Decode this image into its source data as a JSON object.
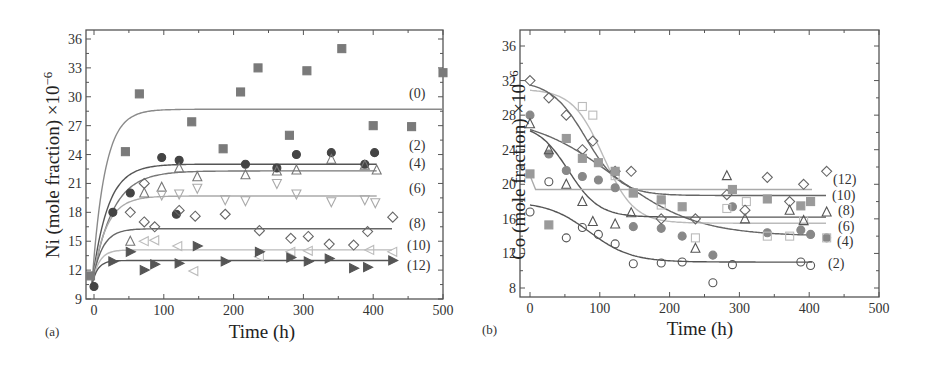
{
  "chart_data": [
    {
      "panel": "(a)",
      "type": "scatter",
      "title": "",
      "xlabel": "Time (h)",
      "ylabel": "Ni (mole fraction) ×10",
      "ylabel_exponent": "−6",
      "xlim": [
        -10,
        500
      ],
      "ylim": [
        9,
        37
      ],
      "xticks": [
        0,
        100,
        200,
        300,
        400,
        500
      ],
      "yticks": [
        9,
        12,
        15,
        18,
        21,
        24,
        27,
        30,
        33,
        36
      ],
      "grid": false,
      "legend": "inline curve labels at right",
      "series": [
        {
          "name": "(0)",
          "marker": "square",
          "fill": "#7a7a7a",
          "line": "#8a8a8a",
          "plateau": 28.7,
          "rate": 0.055,
          "points": [
            [
              -5,
              11.4
            ],
            [
              45,
              24.3
            ],
            [
              65,
              30.3
            ],
            [
              140,
              27.4
            ],
            [
              185,
              24.6
            ],
            [
              210,
              30.5
            ],
            [
              235,
              33.0
            ],
            [
              280,
              26.0
            ],
            [
              305,
              32.7
            ],
            [
              355,
              35.0
            ],
            [
              400,
              27.0
            ],
            [
              455,
              26.9
            ],
            [
              500,
              32.5
            ]
          ]
        },
        {
          "name": "(2)",
          "marker": "circle",
          "fill": "#444444",
          "line": "#555555",
          "plateau": 23.0,
          "rate": 0.045,
          "points": [
            [
              0,
              10.3
            ],
            [
              27,
              18.0
            ],
            [
              52,
              20.0
            ],
            [
              97,
              23.7
            ],
            [
              122,
              23.4
            ],
            [
              118,
              17.8
            ],
            [
              217,
              23.0
            ],
            [
              262,
              22.6
            ],
            [
              290,
              24.0
            ],
            [
              340,
              24.2
            ],
            [
              388,
              23.0
            ],
            [
              402,
              24.2
            ]
          ]
        },
        {
          "name": "(4)",
          "marker": "triangle-up",
          "fill": "none",
          "line": "#777777",
          "plateau": 22.3,
          "rate": 0.035,
          "points": [
            [
              52,
              15.0
            ],
            [
              72,
              20.0
            ],
            [
              97,
              20.6
            ],
            [
              122,
              22.6
            ],
            [
              148,
              21.7
            ],
            [
              217,
              21.9
            ],
            [
              262,
              22.3
            ],
            [
              290,
              22.4
            ],
            [
              340,
              23.5
            ],
            [
              388,
              22.9
            ],
            [
              405,
              22.4
            ]
          ]
        },
        {
          "name": "(6)",
          "marker": "triangle-down",
          "fill": "none",
          "line": "#aaaaaa",
          "plateau": 19.7,
          "rate": 0.05,
          "points": [
            [
              97,
              19.8
            ],
            [
              122,
              19.9
            ],
            [
              148,
              20.5
            ],
            [
              188,
              19.3
            ],
            [
              217,
              19.2
            ],
            [
              262,
              21.0
            ],
            [
              290,
              19.9
            ],
            [
              340,
              19.1
            ],
            [
              388,
              19.3
            ],
            [
              403,
              19.0
            ]
          ]
        },
        {
          "name": "(8)",
          "marker": "diamond",
          "fill": "none",
          "line": "#666666",
          "plateau": 16.3,
          "rate": 0.07,
          "points": [
            [
              52,
              18.0
            ],
            [
              72,
              21.0
            ],
            [
              72,
              17.0
            ],
            [
              87,
              16.5
            ],
            [
              122,
              18.2
            ],
            [
              145,
              17.6
            ],
            [
              188,
              17.8
            ],
            [
              237,
              16.1
            ],
            [
              282,
              15.3
            ],
            [
              307,
              15.5
            ],
            [
              337,
              14.7
            ],
            [
              372,
              14.6
            ],
            [
              392,
              16.0
            ],
            [
              428,
              17.5
            ]
          ]
        },
        {
          "name": "(10)",
          "marker": "triangle-left",
          "fill": "none",
          "line": "#bbbbbb",
          "plateau": 14.1,
          "rate": 0.1,
          "points": [
            [
              72,
              15.0
            ],
            [
              87,
              15.1
            ],
            [
              120,
              14.5
            ],
            [
              143,
              11.9
            ],
            [
              237,
              13.4
            ],
            [
              282,
              13.9
            ],
            [
              307,
              14.0
            ],
            [
              395,
              14.1
            ],
            [
              428,
              13.9
            ]
          ]
        },
        {
          "name": "(12)",
          "marker": "triangle-right",
          "fill": "#555555",
          "line": "#555555",
          "plateau": 13.0,
          "rate": 0.12,
          "points": [
            [
              27,
              12.9
            ],
            [
              52,
              13.9
            ],
            [
              72,
              12.0
            ],
            [
              87,
              12.6
            ],
            [
              122,
              12.7
            ],
            [
              148,
              14.5
            ],
            [
              188,
              12.9
            ],
            [
              237,
              13.9
            ],
            [
              282,
              13.3
            ],
            [
              307,
              12.9
            ],
            [
              337,
              13.2
            ],
            [
              372,
              12.2
            ],
            [
              392,
              12.3
            ],
            [
              428,
              13.0
            ]
          ]
        }
      ],
      "curve_labels": [
        "(0)",
        "(2)",
        "(4)",
        "(6)",
        "(8)",
        "(10)",
        "(12)"
      ]
    },
    {
      "panel": "(b)",
      "type": "scatter",
      "title": "",
      "xlabel": "Time (h)",
      "ylabel": "Co (mole fraction) ×10",
      "ylabel_exponent": "−6",
      "xlim": [
        -10,
        500
      ],
      "ylim": [
        7,
        38
      ],
      "xticks": [
        0,
        100,
        200,
        300,
        400,
        500
      ],
      "yticks": [
        8,
        12,
        16,
        20,
        24,
        28,
        32,
        36
      ],
      "grid": false,
      "legend": "inline curve labels at right",
      "series": [
        {
          "name": "(2)",
          "marker": "circle",
          "fill": "none",
          "line": "#555555",
          "start": 18.0,
          "plateau": 11.0,
          "mid": 85,
          "width": 30,
          "points": [
            [
              0,
              16.8
            ],
            [
              27,
              20.3
            ],
            [
              52,
              13.8
            ],
            [
              75,
              15.0
            ],
            [
              98,
              14.2
            ],
            [
              122,
              13.1
            ],
            [
              148,
              10.8
            ],
            [
              188,
              10.9
            ],
            [
              218,
              11.0
            ],
            [
              262,
              8.6
            ],
            [
              290,
              10.7
            ],
            [
              388,
              11.0
            ],
            [
              402,
              10.6
            ]
          ]
        },
        {
          "name": "(4)",
          "marker": "circle-filled",
          "fill": "#888888",
          "line": "#666666",
          "start": 28.0,
          "plateau": 14.0,
          "mid": 120,
          "width": 60,
          "points": [
            [
              0,
              28.0
            ],
            [
              27,
              23.5
            ],
            [
              52,
              21.6
            ],
            [
              75,
              20.9
            ],
            [
              98,
              20.5
            ],
            [
              122,
              19.6
            ],
            [
              148,
              15.1
            ],
            [
              188,
              14.9
            ],
            [
              218,
              14.0
            ],
            [
              262,
              11.8
            ],
            [
              290,
              17.4
            ],
            [
              340,
              14.4
            ],
            [
              388,
              14.7
            ],
            [
              402,
              14.2
            ],
            [
              425,
              13.8
            ]
          ]
        },
        {
          "name": "(6)",
          "marker": "square-open",
          "fill": "none",
          "line": "#bbbbbb",
          "start": 31.0,
          "plateau": 15.5,
          "mid": 105,
          "width": 22,
          "points": [
            [
              75,
              29.0
            ],
            [
              90,
              28.0
            ],
            [
              122,
              21.0
            ],
            [
              148,
              19.0
            ],
            [
              188,
              17.6
            ],
            [
              237,
              13.8
            ],
            [
              282,
              17.2
            ],
            [
              310,
              18.0
            ],
            [
              340,
              14.0
            ],
            [
              372,
              14.0
            ],
            [
              392,
              15.8
            ],
            [
              425,
              13.8
            ]
          ]
        },
        {
          "name": "(8)",
          "marker": "triangle-up",
          "fill": "none",
          "line": "#555555",
          "start": 27.0,
          "plateau": 16.2,
          "mid": 55,
          "width": 22,
          "points": [
            [
              0,
              27.0
            ],
            [
              27,
              24.0
            ],
            [
              52,
              20.0
            ],
            [
              75,
              18.0
            ],
            [
              90,
              15.7
            ],
            [
              122,
              15.4
            ],
            [
              145,
              16.7
            ],
            [
              237,
              12.6
            ],
            [
              282,
              21.0
            ],
            [
              308,
              16.0
            ],
            [
              372,
              17.0
            ],
            [
              392,
              15.8
            ],
            [
              425,
              16.8
            ]
          ]
        },
        {
          "name": "(10)",
          "marker": "diamond",
          "fill": "none",
          "line": "#666666",
          "start": 32.0,
          "plateau": 18.7,
          "mid": 80,
          "width": 25,
          "points": [
            [
              0,
              32.0
            ],
            [
              27,
              30.0
            ],
            [
              52,
              28.0
            ],
            [
              75,
              24.0
            ],
            [
              90,
              25.0
            ],
            [
              122,
              21.5
            ],
            [
              145,
              21.5
            ],
            [
              188,
              16.0
            ],
            [
              237,
              16.0
            ],
            [
              282,
              18.8
            ],
            [
              308,
              17.0
            ],
            [
              340,
              20.8
            ],
            [
              372,
              18.0
            ],
            [
              392,
              20.0
            ],
            [
              425,
              21.5
            ]
          ]
        },
        {
          "name": "(12)",
          "marker": "square-filled",
          "fill": "#9a9a9a",
          "line": "#aaaaaa",
          "start": 21.0,
          "plateau": 19.4,
          "mid": 3,
          "width": 1.5,
          "points": [
            [
              0,
              21.2
            ],
            [
              27,
              15.3
            ],
            [
              52,
              25.3
            ],
            [
              75,
              23.0
            ],
            [
              98,
              22.5
            ],
            [
              122,
              21.5
            ],
            [
              148,
              19.0
            ],
            [
              188,
              18.2
            ],
            [
              218,
              17.4
            ],
            [
              290,
              19.4
            ],
            [
              340,
              18.3
            ],
            [
              388,
              17.5
            ],
            [
              402,
              18.0
            ]
          ]
        }
      ],
      "curve_labels": [
        "(12)",
        "(10)",
        "(8)",
        "(6)",
        "(4)",
        "(2)"
      ]
    }
  ],
  "panels": {
    "a": {
      "label": "(a)",
      "xlabel": "Time (h)",
      "ylabel_main": "Ni (mole fraction) ×10",
      "ylabel_exp": "−6"
    },
    "b": {
      "label": "(b)",
      "xlabel": "Time (h)",
      "ylabel_main": "Co (mole fraction) ×10",
      "ylabel_exp": "−6"
    }
  }
}
